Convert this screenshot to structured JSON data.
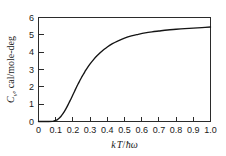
{
  "chart_data": {
    "type": "line",
    "title": "",
    "xlabel": "kT/ħω",
    "ylabel": "C_v, cal/mole-deg",
    "xlabel_parts": {
      "k": "k",
      "T": "T",
      "slash": "/",
      "hbar": "ħ",
      "omega": "ω"
    },
    "ylabel_parts": {
      "symbol": "C",
      "subscript": "v",
      "rest": ", cal/mole-deg"
    },
    "xlim": [
      0,
      1.0
    ],
    "ylim": [
      0,
      6
    ],
    "grid": false,
    "legend": null,
    "xticks": [
      "0",
      "0.1",
      "0.2",
      "0.3",
      "0.4",
      "0.5",
      "0.6",
      "0.7",
      "0.8",
      "0.9",
      "1.0"
    ],
    "xtick_values": [
      0,
      0.1,
      0.2,
      0.3,
      0.4,
      0.5,
      0.6,
      0.7,
      0.8,
      0.9,
      1.0
    ],
    "yticks": [
      "0",
      "1",
      "2",
      "3",
      "4",
      "5",
      "6"
    ],
    "ytick_values": [
      0,
      1,
      2,
      3,
      4,
      5,
      6
    ],
    "tick_direction": "in",
    "series": [
      {
        "name": "Einstein heat capacity",
        "color": "#141414",
        "x": [
          0.0,
          0.02,
          0.04,
          0.06,
          0.08,
          0.09,
          0.1,
          0.11,
          0.12,
          0.13,
          0.14,
          0.15,
          0.16,
          0.17,
          0.18,
          0.19,
          0.2,
          0.21,
          0.22,
          0.23,
          0.24,
          0.25,
          0.26,
          0.27,
          0.28,
          0.3,
          0.32,
          0.34,
          0.36,
          0.38,
          0.4,
          0.43,
          0.46,
          0.5,
          0.54,
          0.58,
          0.62,
          0.66,
          0.7,
          0.75,
          0.8,
          0.85,
          0.9,
          0.95,
          1.0
        ],
        "y": [
          0.0,
          0.0,
          0.0,
          0.0,
          0.01,
          0.03,
          0.06,
          0.11,
          0.19,
          0.29,
          0.42,
          0.57,
          0.74,
          0.93,
          1.13,
          1.33,
          1.54,
          1.75,
          1.96,
          2.16,
          2.35,
          2.54,
          2.71,
          2.88,
          3.04,
          3.32,
          3.57,
          3.79,
          3.98,
          4.15,
          4.3,
          4.49,
          4.64,
          4.81,
          4.94,
          5.03,
          5.11,
          5.17,
          5.22,
          5.28,
          5.32,
          5.36,
          5.39,
          5.42,
          5.45
        ]
      }
    ],
    "annotations": []
  },
  "figure": {
    "background_color": "#ffffff",
    "axis_color": "#2b2b2b",
    "curve_color": "#141414"
  }
}
